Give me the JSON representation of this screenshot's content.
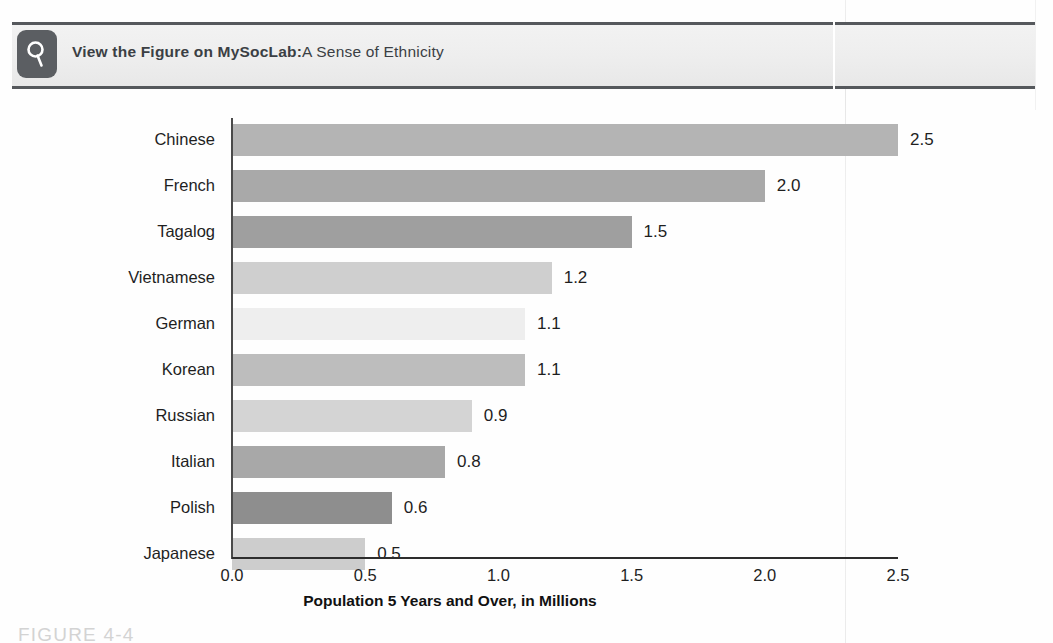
{
  "banner": {
    "icon": "magnifying-glass-icon",
    "text_parts": [
      {
        "t": "View the ",
        "bold": true
      },
      {
        "t": "Figure ",
        "bold": true
      },
      {
        "t": "on ",
        "bold": true
      },
      {
        "t": "MySocLab:",
        "bold": true
      },
      {
        "t": "A Sense of Ethnicity",
        "bold": false
      }
    ],
    "full_text": "View the Figure on MySocLab:A Sense of Ethnicity"
  },
  "figure_caption": "FIGURE 4-4",
  "chart_data": {
    "type": "bar",
    "orientation": "horizontal",
    "title": "",
    "xlabel": "Population 5 Years and Over, in Millions",
    "ylabel": "",
    "xlim": [
      0.0,
      2.5
    ],
    "xticks": [
      "0.0",
      "0.5",
      "1.0",
      "1.5",
      "2.0",
      "2.5"
    ],
    "xtick_values": [
      0.0,
      0.5,
      1.0,
      1.5,
      2.0,
      2.5
    ],
    "grid": false,
    "legend": "none",
    "categories": [
      "Chinese",
      "French",
      "Tagalog",
      "Vietnamese",
      "German",
      "Korean",
      "Russian",
      "Italian",
      "Polish",
      "Japanese"
    ],
    "values": [
      2.5,
      2.0,
      1.5,
      1.2,
      1.1,
      1.1,
      0.9,
      0.8,
      0.6,
      0.5
    ],
    "value_labels": [
      "2.5",
      "2.0",
      "1.5",
      "1.2",
      "1.1",
      "1.1",
      "0.9",
      "0.8",
      "0.6",
      "0.5"
    ],
    "bar_colors": [
      "#b4b4b4",
      "#a9a9a9",
      "#9f9f9f",
      "#cfcfcf",
      "#eeeeee",
      "#bdbdbd",
      "#d4d4d4",
      "#a8a8a8",
      "#8e8e8e",
      "#cdcdcd"
    ]
  },
  "colors": {
    "band_background": "#eeeeee",
    "band_rule": "#55585c",
    "icon_background": "#5b5e62",
    "axis": "#2d2d2d",
    "text": "#1f1f1f",
    "caption": "#d3d3d3"
  }
}
